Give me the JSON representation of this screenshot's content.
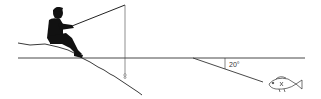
{
  "diagram": {
    "angle_label": "20°",
    "colors": {
      "silhouette": "#111111",
      "lines": "#333333",
      "background": "#ffffff"
    },
    "elements": [
      "fisherman-silhouette",
      "fishing-rod",
      "fishing-line",
      "bobber",
      "shoreline",
      "water-surface",
      "refracted-sightline",
      "normal-tick",
      "angle-label",
      "fish"
    ]
  }
}
